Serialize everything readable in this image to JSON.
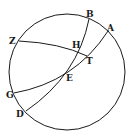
{
  "figure": {
    "type": "spherical-geometry-diagram",
    "circle": {
      "cx": 67,
      "cy": 72,
      "r": 58
    },
    "points": [
      {
        "id": "A",
        "label": "A",
        "x": 108,
        "y": 31,
        "lx": 107,
        "ly": 31
      },
      {
        "id": "B",
        "label": "B",
        "x": 89,
        "y": 19,
        "lx": 86,
        "ly": 17
      },
      {
        "id": "Z",
        "label": "Z",
        "x": 19,
        "y": 41,
        "lx": 9,
        "ly": 44
      },
      {
        "id": "H",
        "label": "H",
        "x": 81,
        "y": 51,
        "lx": 72,
        "ly": 48
      },
      {
        "id": "T",
        "label": "T",
        "x": 87,
        "y": 56,
        "lx": 86,
        "ly": 64
      },
      {
        "id": "E",
        "label": "E",
        "x": 67,
        "y": 74,
        "lx": 66,
        "ly": 81
      },
      {
        "id": "G",
        "label": "G",
        "x": 14,
        "y": 93,
        "lx": 6,
        "ly": 98
      },
      {
        "id": "D",
        "label": "D",
        "x": 26,
        "y": 111,
        "lx": 16,
        "ly": 117
      }
    ],
    "arcs": [
      {
        "name": "arc-BD",
        "path": "M89,19 Q78,75 26,111"
      },
      {
        "name": "arc-AG",
        "path": "M108,31 Q75,82 14,93"
      },
      {
        "name": "arc-ZT",
        "path": "M19,41 Q60,43 87,56"
      }
    ]
  }
}
